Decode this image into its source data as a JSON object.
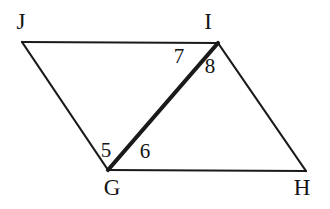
{
  "figure": {
    "kind": "geometry-diagram",
    "background_color": "#ffffff",
    "stroke_color": "#1a1a1a",
    "thin_stroke_width": 2.2,
    "thick_stroke_width": 4.2,
    "vertices": {
      "J": {
        "label": "J",
        "x": 22,
        "y": 42
      },
      "I": {
        "label": "I",
        "x": 218,
        "y": 43
      },
      "G": {
        "label": "G",
        "x": 108,
        "y": 170
      },
      "H": {
        "label": "H",
        "x": 306,
        "y": 171
      }
    },
    "segments": [
      {
        "name": "JI",
        "from": "J",
        "to": "I",
        "weight": "thin"
      },
      {
        "name": "JG",
        "from": "J",
        "to": "G",
        "weight": "thin"
      },
      {
        "name": "GH",
        "from": "G",
        "to": "H",
        "weight": "thin"
      },
      {
        "name": "IH",
        "from": "I",
        "to": "H",
        "weight": "thin"
      },
      {
        "name": "GI",
        "from": "G",
        "to": "I",
        "weight": "thick"
      }
    ],
    "angle_labels": {
      "a5": "5",
      "a6": "6",
      "a7": "7",
      "a8": "8"
    },
    "vertex_labels": {
      "J": "J",
      "I": "I",
      "G": "G",
      "H": "H"
    }
  }
}
